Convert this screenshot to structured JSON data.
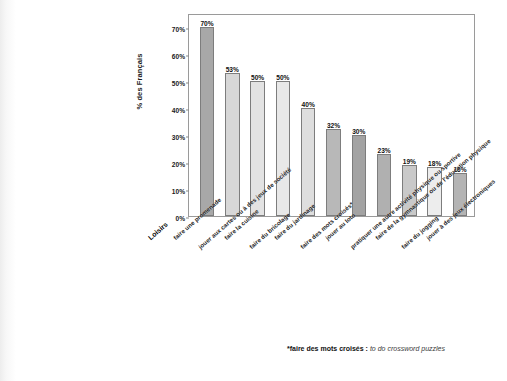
{
  "footnote": {
    "term": "*faire des mots croisés :",
    "gloss": "to do crossword puzzles"
  },
  "chart_data": {
    "type": "bar",
    "title": "",
    "xlabel": "Loisirs",
    "ylabel": "% des Français",
    "ylim": [
      0,
      75
    ],
    "grid": false,
    "legend": "none",
    "yticks": [
      "0%",
      "10%",
      "20%",
      "30%",
      "40%",
      "50%",
      "60%",
      "70%"
    ],
    "ytick_values": [
      0,
      10,
      20,
      30,
      40,
      50,
      60,
      70
    ],
    "categories": [
      "faire une promenade",
      "jouer aux cartes ou à des jeux de société",
      "faire la cuisine",
      "faire du bricolage",
      "faire du jardinage",
      "faire des mots croisés*",
      "jouer au loto",
      "pratiquer une autre activité physique ou sportive",
      "faire de la gymnastique ou de l'éducation physique",
      "faire du jogging",
      "jouer à des jeux électroniques"
    ],
    "values": [
      70,
      53,
      50,
      50,
      40,
      32,
      30,
      23,
      19,
      18,
      16
    ],
    "value_labels": [
      "70%",
      "53%",
      "50%",
      "50%",
      "40%",
      "32%",
      "30%",
      "23%",
      "19%",
      "18%",
      "16%"
    ],
    "bar_colors": [
      "#a8a8a8",
      "#d7d7d7",
      "#e3e3e3",
      "#e8e8e8",
      "#dedede",
      "#b8b8b8",
      "#a3a3a3",
      "#b0b0b0",
      "#c9c9c9",
      "#ededed",
      "#b4b4b4"
    ]
  }
}
